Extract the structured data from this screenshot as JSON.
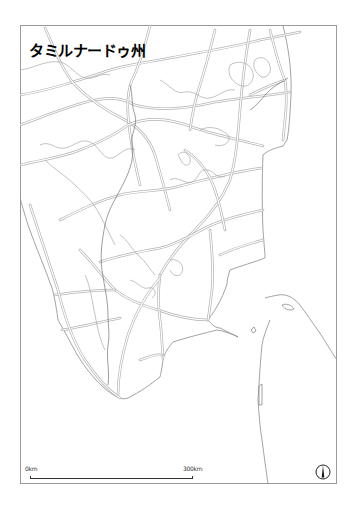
{
  "map": {
    "title": "タミルナードゥ州",
    "scale": {
      "start_label": "0km",
      "end_label": "300km"
    },
    "north_arrow": "north-arrow-icon",
    "colors": {
      "frame": "#9a9a9a",
      "coast": "#8c8c8c",
      "road": "#b4b4b4",
      "title": "#000000"
    }
  }
}
